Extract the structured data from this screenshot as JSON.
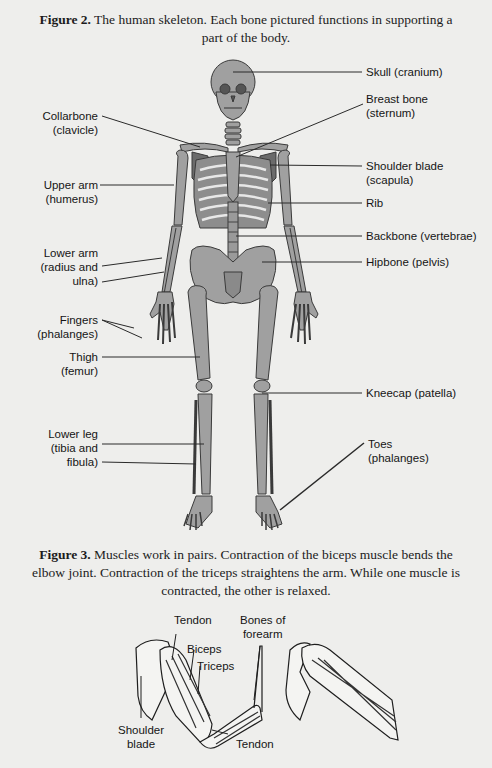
{
  "figure2": {
    "caption_bold": "Figure 2.",
    "caption_text": " The human skeleton. Each bone pictured functions in supporting a",
    "caption_line2": "part of the body.",
    "labels": {
      "skull": "Skull (cranium)",
      "breast_bone_1": "Breast bone",
      "breast_bone_2": "(sternum)",
      "collarbone_1": "Collarbone",
      "collarbone_2": "(clavicle)",
      "shoulder_blade_1": "Shoulder blade",
      "shoulder_blade_2": "(scapula)",
      "upper_arm_1": "Upper arm",
      "upper_arm_2": "(humerus)",
      "rib": "Rib",
      "backbone": "Backbone (vertebrae)",
      "lower_arm_1": "Lower arm",
      "lower_arm_2": "(radius and",
      "lower_arm_3": "ulna)",
      "hipbone": "Hipbone (pelvis)",
      "fingers_1": "Fingers",
      "fingers_2": "(phalanges)",
      "thigh_1": "Thigh",
      "thigh_2": "(femur)",
      "kneecap": "Kneecap (patella)",
      "lower_leg_1": "Lower leg",
      "lower_leg_2": "(tibia and",
      "lower_leg_3": "fibula)",
      "toes_1": "Toes",
      "toes_2": "(phalanges)"
    }
  },
  "figure3": {
    "caption_bold": "Figure 3.",
    "caption_text": " Muscles work in pairs. Contraction of the biceps muscle bends the",
    "caption_line2": "elbow joint. Contraction of the triceps straightens the arm. While one muscle is",
    "caption_line3": "contracted, the other is relaxed.",
    "labels": {
      "tendon_top": "Tendon",
      "bones_forearm_1": "Bones of",
      "bones_forearm_2": "forearm",
      "biceps": "Biceps",
      "triceps": "Triceps",
      "shoulder_blade_1": "Shoulder",
      "shoulder_blade_2": "blade",
      "tendon_bottom": "Tendon"
    }
  },
  "colors": {
    "background": "#eeeeec",
    "bone_fill": "#a0a0a0",
    "bone_outline": "#3a3a3a",
    "leader_line": "#2a2a2a"
  }
}
